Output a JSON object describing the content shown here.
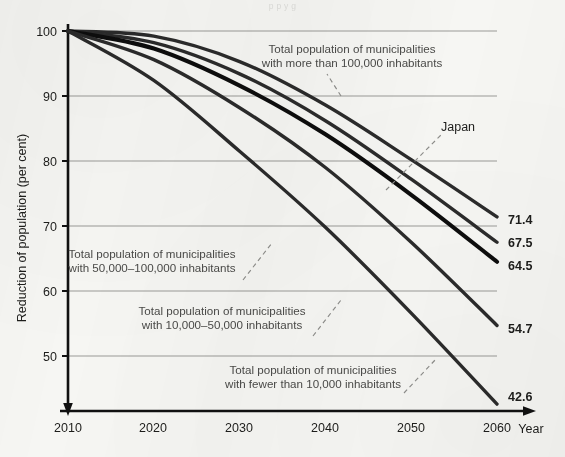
{
  "top_cropped_text": "p p y g",
  "chart_data": {
    "type": "line",
    "title": "",
    "xlabel": "Year",
    "ylabel": "Reduction of population (per cent)",
    "x": [
      2010,
      2020,
      2030,
      2040,
      2050,
      2060
    ],
    "xlim": [
      2010,
      2060
    ],
    "ylim": [
      42,
      101
    ],
    "yticks": [
      100,
      90,
      80,
      70,
      60,
      50
    ],
    "xticks": [
      "2010",
      "2020",
      "2030",
      "2040",
      "2050",
      "2060"
    ],
    "grid": true,
    "legend": "annotations with dashed leader lines",
    "series": [
      {
        "name": "Total population of municipalities with more than 100,000 inhabitants",
        "values": [
          100,
          99.2,
          95.3,
          88.6,
          80.2,
          71.4
        ],
        "end_value": "71.4",
        "emphasis": false
      },
      {
        "name": "Total population of municipalities with 50,000-100,000 inhabitants",
        "values": [
          100,
          98.2,
          93.4,
          86.2,
          77.2,
          67.5
        ],
        "end_value": "67.5",
        "emphasis": false
      },
      {
        "name": "Japan",
        "values": [
          100,
          97.3,
          91.6,
          84.1,
          74.8,
          64.5
        ],
        "end_value": "64.5",
        "emphasis": true
      },
      {
        "name": "Total population of municipalities with 10,000-50,000 inhabitants",
        "values": [
          100,
          95.6,
          88.2,
          79.0,
          67.5,
          54.7
        ],
        "end_value": "54.7",
        "emphasis": false
      },
      {
        "name": "Total population of municipalities with fewer than 10,000 inhabitants",
        "values": [
          100,
          92.4,
          81.5,
          69.8,
          56.6,
          42.6
        ],
        "end_value": "42.6",
        "emphasis": false
      }
    ],
    "annotations": [
      {
        "id": "annot-over-100000",
        "line1": "Total population of municipalities",
        "line2": "with more than 100,000 inhabitants"
      },
      {
        "id": "annot-japan",
        "line1": "Japan",
        "line2": ""
      },
      {
        "id": "annot-50000-100000",
        "line1": "Total population of municipalities",
        "line2": "with 50,000–100,000 inhabitants"
      },
      {
        "id": "annot-10000-50000",
        "line1": "Total population of municipalities",
        "line2": "with 10,000–50,000 inhabitants"
      },
      {
        "id": "annot-under-10000",
        "line1": "Total population of municipalities",
        "line2": "with fewer than 10,000 inhabitants"
      }
    ],
    "colors": {
      "background": "#f6f6f3",
      "line": "#2b2b2b",
      "line_emphasis": "#0d0d0d",
      "gridline": "#9a9a97",
      "axis": "#111111",
      "annotation_text": "#4a4a48",
      "leader": "#8d8d8a"
    }
  }
}
